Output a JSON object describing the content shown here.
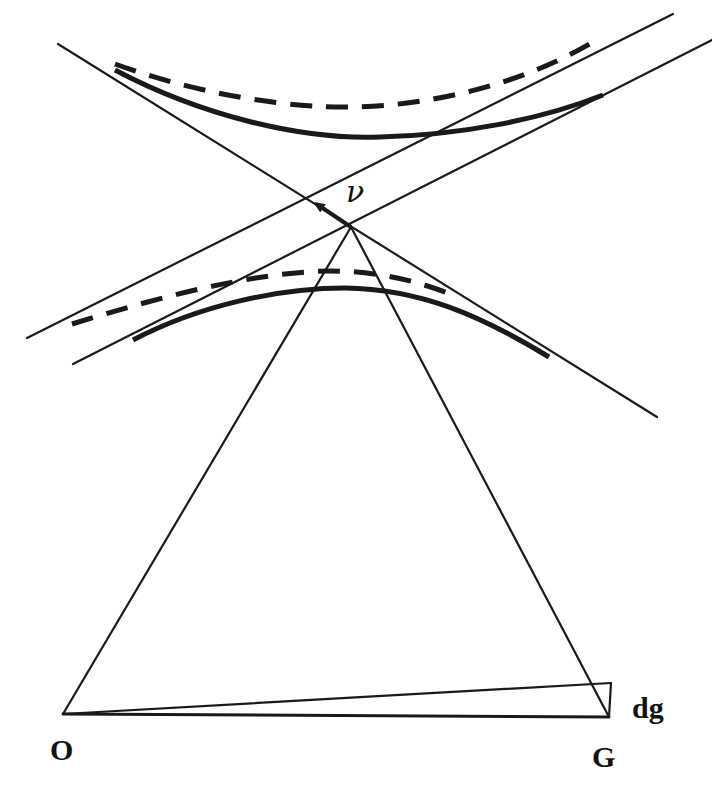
{
  "diagram": {
    "type": "geometric-construction",
    "labels": {
      "vector": "ν",
      "origin": "O",
      "point_g": "G",
      "displacement": "dg"
    },
    "points": {
      "vertex": [
        351,
        227
      ],
      "crossing": [
        308,
        199
      ],
      "arrow_tip": [
        313,
        202
      ],
      "O": [
        63,
        714
      ],
      "G": [
        609,
        717
      ],
      "G_displaced": [
        611,
        683
      ]
    },
    "lines": {
      "diagonal_down": {
        "from": [
          58,
          44
        ],
        "to": [
          657,
          417
        ]
      },
      "upper_parallel": {
        "from": [
          27,
          338
        ],
        "to": [
          673,
          14
        ]
      },
      "lower_parallel": {
        "from": [
          73,
          364
        ],
        "to": [
          712,
          40
        ]
      },
      "vertex_to_O": {
        "from": [
          351,
          227
        ],
        "to": [
          63,
          714
        ]
      },
      "vertex_to_G": {
        "from": [
          351,
          227
        ],
        "to": [
          609,
          717
        ]
      },
      "O_to_G": {
        "from": [
          63,
          714
        ],
        "to": [
          609,
          717
        ]
      },
      "O_to_G_displaced": {
        "from": [
          63,
          714
        ],
        "to": [
          611,
          683
        ]
      },
      "dg_segment": {
        "from": [
          611,
          683
        ],
        "to": [
          609,
          717
        ]
      }
    },
    "curves": {
      "upper_solid": "M115,70 C200,115 300,140 380,137 C460,135 540,120 603,95",
      "upper_dashed": "M115,64 C200,95 290,108 350,107 C430,106 520,85 593,42",
      "lower_solid": "M133,340 C200,305 280,288 345,288 C420,289 480,315 549,357",
      "lower_dashed": "M72,324 C150,300 250,272 330,271 C380,271 420,282 450,294"
    },
    "colors": {
      "ink": "#1a1a1a",
      "background": "#ffffff"
    }
  }
}
